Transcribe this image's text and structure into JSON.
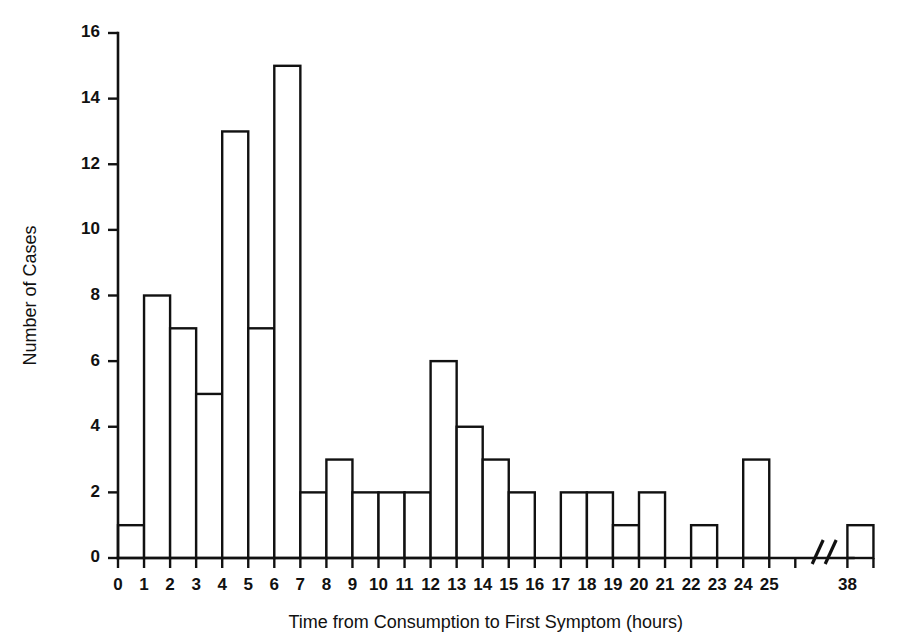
{
  "chart_data": {
    "type": "bar",
    "title": "",
    "subtitle": "",
    "xlabel": "Time from Consumption to First Symptom (hours)",
    "ylabel": "Number of Cases",
    "grid": false,
    "legend": "none",
    "ylim": [
      0,
      16
    ],
    "yticks": [
      0,
      2,
      4,
      6,
      8,
      10,
      12,
      14,
      16
    ],
    "ytick_labels": [
      "0",
      "2",
      "4",
      "6",
      "8",
      "10",
      "12",
      "14",
      "16"
    ],
    "xlim": [
      0,
      26
    ],
    "xtick_labels": [
      "0",
      "1",
      "2",
      "3",
      "4",
      "5",
      "6",
      "7",
      "8",
      "9",
      "10",
      "11",
      "12",
      "13",
      "14",
      "15",
      "16",
      "17",
      "18",
      "19",
      "20",
      "21",
      "22",
      "23",
      "24",
      "25",
      "38"
    ],
    "axis_break": {
      "present": true,
      "symbol": "//",
      "between": [
        "25",
        "38"
      ]
    },
    "bin_width": 1,
    "categories": [
      "0-1",
      "1-2",
      "2-3",
      "3-4",
      "4-5",
      "5-6",
      "6-7",
      "7-8",
      "8-9",
      "9-10",
      "10-11",
      "11-12",
      "12-13",
      "13-14",
      "14-15",
      "15-16",
      "16-17",
      "17-18",
      "18-19",
      "19-20",
      "20-21",
      "21-22",
      "22-23",
      "23-24",
      "24-25",
      "37-38"
    ],
    "values": [
      1,
      8,
      7,
      5,
      13,
      7,
      15,
      2,
      3,
      2,
      2,
      2,
      6,
      4,
      3,
      2,
      0,
      2,
      2,
      1,
      2,
      0,
      1,
      0,
      3,
      1
    ],
    "total_cases": 94
  },
  "axes": {
    "y_title": "Number of Cases",
    "x_title": "Time from Consumption to First Symptom (hours)"
  }
}
